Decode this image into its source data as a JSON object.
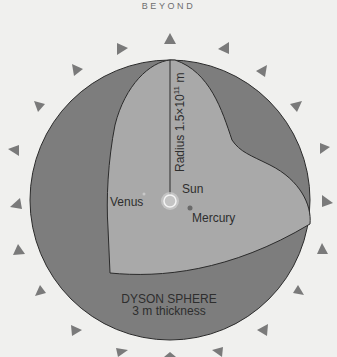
{
  "header": {
    "title": "BEYOND"
  },
  "diagram": {
    "radius_label": "Radius 1.5×10",
    "radius_exponent": "11",
    "radius_unit": " m",
    "sun_label": "Sun",
    "venus_label": "Venus",
    "mercury_label": "Mercury",
    "sphere_label": "DYSON SPHERE",
    "thickness_label": "3 m thickness",
    "arrow_count": 20,
    "colors": {
      "background": "#f0f0ee",
      "sphere_shell": "#7d7d7d",
      "cutaway_interior": "#a9a9a9",
      "arrows": "#7a7a7a",
      "outline": "#2b2b2b",
      "sun": "#d4d4d4"
    }
  }
}
